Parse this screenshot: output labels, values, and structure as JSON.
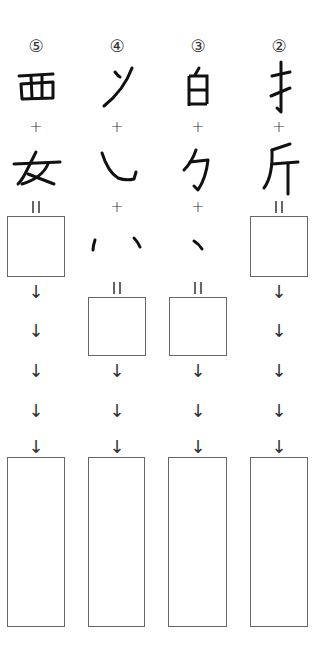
{
  "columns": [
    {
      "number": "⑤",
      "parts": [
        "西",
        "女"
      ],
      "operators": [
        "+",
        "="
      ],
      "arrows": [
        "↓",
        "↓",
        "↓",
        "↓",
        "↓"
      ]
    },
    {
      "number": "④",
      "parts": [
        "ソ",
        "乚",
        "丶丶"
      ],
      "operators": [
        "+",
        "+",
        "="
      ],
      "arrows": [
        "↓",
        "↓",
        "↓"
      ]
    },
    {
      "number": "③",
      "parts": [
        "白",
        "勹",
        "丶"
      ],
      "operators": [
        "+",
        "+",
        "="
      ],
      "arrows": [
        "↓",
        "↓",
        "↓"
      ]
    },
    {
      "number": "②",
      "parts": [
        "扌",
        "斤"
      ],
      "operators": [
        "+",
        "="
      ],
      "arrows": [
        "↓",
        "↓",
        "↓",
        "↓",
        "↓"
      ]
    }
  ]
}
